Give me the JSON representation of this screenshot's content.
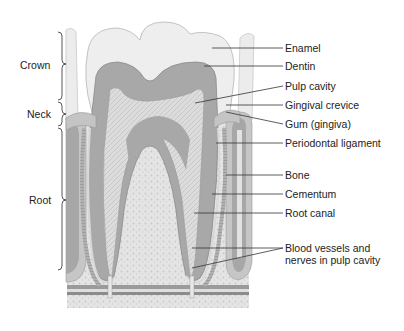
{
  "regions": [
    {
      "id": "crown",
      "label": "Crown"
    },
    {
      "id": "neck",
      "label": "Neck"
    },
    {
      "id": "root",
      "label": "Root"
    }
  ],
  "labels": [
    {
      "id": "enamel",
      "label": "Enamel"
    },
    {
      "id": "dentin",
      "label": "Dentin"
    },
    {
      "id": "pulp-cavity",
      "label": "Pulp cavity"
    },
    {
      "id": "gingival-crevice",
      "label": "Gingival crevice"
    },
    {
      "id": "gum",
      "label": "Gum (gingiva)"
    },
    {
      "id": "periodontal-ligament",
      "label": "Periodontal ligament"
    },
    {
      "id": "bone",
      "label": "Bone"
    },
    {
      "id": "cementum",
      "label": "Cementum"
    },
    {
      "id": "root-canal",
      "label": "Root canal"
    },
    {
      "id": "blood-vessels",
      "label": "Blood vessels and nerves in pulp cavity"
    }
  ],
  "colors": {
    "enamel": "#ececec",
    "dentin": "#a9a9a9",
    "pulp": "#d6d6d6",
    "bone": "#e0e0e0",
    "gum": "#c4c4c4",
    "line": "#333333"
  }
}
